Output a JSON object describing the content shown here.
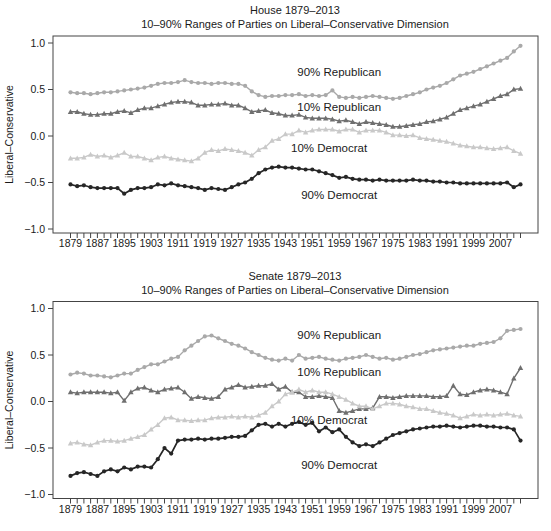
{
  "years": [
    1879,
    1881,
    1883,
    1885,
    1887,
    1889,
    1891,
    1893,
    1895,
    1897,
    1899,
    1901,
    1903,
    1905,
    1907,
    1909,
    1911,
    1913,
    1915,
    1917,
    1919,
    1921,
    1923,
    1925,
    1927,
    1929,
    1931,
    1933,
    1935,
    1937,
    1939,
    1941,
    1943,
    1945,
    1947,
    1949,
    1951,
    1953,
    1955,
    1957,
    1959,
    1961,
    1963,
    1965,
    1967,
    1969,
    1971,
    1973,
    1975,
    1977,
    1979,
    1981,
    1983,
    1985,
    1987,
    1989,
    1991,
    1993,
    1995,
    1997,
    1999,
    2001,
    2003,
    2005,
    2007,
    2009,
    2011,
    2013
  ],
  "colors": {
    "rep90": "#a9a9a9",
    "rep10": "#6f6f6f",
    "dem10": "#c9c9c9",
    "dem90": "#262626",
    "axis": "#444444",
    "text": "#1a1a1a"
  },
  "chart_data": [
    {
      "type": "line",
      "title": "House 1879–2013",
      "subtitle": "10–90% Ranges of Parties on Liberal–Conservative Dimension",
      "ylabel": "Liberal–Conservative",
      "ylim": [
        -1.0,
        1.0
      ],
      "yticks": [
        "1.0",
        "0.5",
        "0.0",
        "−0.5",
        "−1.0"
      ],
      "ytick_values": [
        1.0,
        0.5,
        0.0,
        -0.5,
        -1.0
      ],
      "xtick_label_years": [
        1879,
        1887,
        1895,
        1903,
        1911,
        1919,
        1927,
        1935,
        1943,
        1951,
        1959,
        1967,
        1975,
        1983,
        1991,
        1999,
        2007
      ],
      "grid": false,
      "legend": "in-plot text annotations",
      "series": [
        {
          "name": "90% Republican",
          "marker": "circle",
          "color": "#a9a9a9",
          "values": [
            0.47,
            0.46,
            0.46,
            0.45,
            0.46,
            0.47,
            0.47,
            0.48,
            0.49,
            0.5,
            0.51,
            0.52,
            0.54,
            0.56,
            0.57,
            0.57,
            0.58,
            0.6,
            0.58,
            0.57,
            0.57,
            0.56,
            0.57,
            0.57,
            0.56,
            0.56,
            0.54,
            0.48,
            0.44,
            0.42,
            0.43,
            0.43,
            0.44,
            0.44,
            0.45,
            0.43,
            0.44,
            0.43,
            0.44,
            0.49,
            0.42,
            0.41,
            0.42,
            0.41,
            0.42,
            0.43,
            0.42,
            0.41,
            0.4,
            0.41,
            0.43,
            0.45,
            0.47,
            0.5,
            0.52,
            0.54,
            0.57,
            0.61,
            0.65,
            0.67,
            0.69,
            0.72,
            0.75,
            0.78,
            0.81,
            0.84,
            0.91,
            0.97
          ]
        },
        {
          "name": "10% Republican",
          "marker": "triangle",
          "color": "#6f6f6f",
          "values": [
            0.26,
            0.26,
            0.24,
            0.23,
            0.23,
            0.24,
            0.24,
            0.26,
            0.27,
            0.25,
            0.28,
            0.3,
            0.3,
            0.32,
            0.34,
            0.36,
            0.37,
            0.37,
            0.36,
            0.33,
            0.33,
            0.34,
            0.34,
            0.35,
            0.33,
            0.33,
            0.3,
            0.26,
            0.27,
            0.28,
            0.25,
            0.24,
            0.22,
            0.22,
            0.23,
            0.2,
            0.19,
            0.19,
            0.19,
            0.18,
            0.16,
            0.17,
            0.15,
            0.13,
            0.15,
            0.14,
            0.13,
            0.12,
            0.1,
            0.1,
            0.11,
            0.12,
            0.13,
            0.15,
            0.16,
            0.18,
            0.2,
            0.24,
            0.28,
            0.3,
            0.32,
            0.34,
            0.37,
            0.4,
            0.43,
            0.45,
            0.5,
            0.51
          ]
        },
        {
          "name": "10% Democrat",
          "marker": "triangle",
          "color": "#c9c9c9",
          "values": [
            -0.24,
            -0.24,
            -0.23,
            -0.2,
            -0.22,
            -0.21,
            -0.23,
            -0.21,
            -0.18,
            -0.22,
            -0.22,
            -0.24,
            -0.26,
            -0.23,
            -0.22,
            -0.24,
            -0.25,
            -0.26,
            -0.27,
            -0.24,
            -0.18,
            -0.15,
            -0.16,
            -0.14,
            -0.15,
            -0.16,
            -0.18,
            -0.21,
            -0.15,
            -0.12,
            -0.05,
            -0.03,
            0.02,
            0.02,
            0.06,
            0.04,
            0.06,
            0.07,
            0.07,
            0.07,
            0.05,
            0.07,
            0.07,
            0.04,
            0.06,
            0.06,
            0.06,
            0.04,
            0.01,
            0.01,
            0.0,
            0.01,
            -0.02,
            -0.03,
            -0.04,
            -0.05,
            -0.06,
            -0.08,
            -0.1,
            -0.11,
            -0.12,
            -0.12,
            -0.13,
            -0.14,
            -0.13,
            -0.12,
            -0.16,
            -0.19
          ]
        },
        {
          "name": "90% Democrat",
          "marker": "circle",
          "color": "#262626",
          "values": [
            -0.52,
            -0.54,
            -0.53,
            -0.55,
            -0.56,
            -0.56,
            -0.56,
            -0.56,
            -0.62,
            -0.58,
            -0.56,
            -0.56,
            -0.55,
            -0.52,
            -0.53,
            -0.51,
            -0.53,
            -0.54,
            -0.55,
            -0.56,
            -0.58,
            -0.56,
            -0.57,
            -0.58,
            -0.55,
            -0.52,
            -0.5,
            -0.46,
            -0.4,
            -0.36,
            -0.34,
            -0.33,
            -0.34,
            -0.34,
            -0.35,
            -0.36,
            -0.36,
            -0.38,
            -0.4,
            -0.42,
            -0.45,
            -0.44,
            -0.46,
            -0.47,
            -0.47,
            -0.48,
            -0.47,
            -0.48,
            -0.48,
            -0.48,
            -0.48,
            -0.47,
            -0.48,
            -0.48,
            -0.49,
            -0.49,
            -0.5,
            -0.5,
            -0.51,
            -0.51,
            -0.51,
            -0.51,
            -0.51,
            -0.51,
            -0.51,
            -0.5,
            -0.55,
            -0.52
          ]
        }
      ],
      "annotations": [
        {
          "text": "90% Republican",
          "year": 1959,
          "value": 0.65
        },
        {
          "text": "10% Republican",
          "year": 1959,
          "value": 0.27
        },
        {
          "text": "10% Democrat",
          "year": 1956,
          "value": -0.17
        },
        {
          "text": "90% Democrat",
          "year": 1959,
          "value": -0.68
        }
      ]
    },
    {
      "type": "line",
      "title": "Senate 1879–2013",
      "subtitle": "10–90% Ranges of Parties on Liberal–Conservative Dimension",
      "ylabel": "Liberal–Conservative",
      "ylim": [
        -1.0,
        1.0
      ],
      "yticks": [
        "1.0",
        "0.5",
        "0.0",
        "−0.5",
        "−1.0"
      ],
      "ytick_values": [
        1.0,
        0.5,
        0.0,
        -0.5,
        -1.0
      ],
      "xtick_label_years": [
        1879,
        1887,
        1895,
        1903,
        1911,
        1919,
        1927,
        1935,
        1943,
        1951,
        1959,
        1967,
        1975,
        1983,
        1991,
        1999,
        2007
      ],
      "grid": false,
      "legend": "in-plot text annotations",
      "series": [
        {
          "name": "90% Republican",
          "marker": "circle",
          "color": "#a9a9a9",
          "values": [
            0.29,
            0.31,
            0.3,
            0.28,
            0.28,
            0.27,
            0.26,
            0.28,
            0.3,
            0.3,
            0.34,
            0.37,
            0.4,
            0.4,
            0.43,
            0.46,
            0.48,
            0.55,
            0.6,
            0.65,
            0.7,
            0.71,
            0.68,
            0.65,
            0.62,
            0.6,
            0.57,
            0.53,
            0.5,
            0.47,
            0.45,
            0.44,
            0.46,
            0.44,
            0.5,
            0.46,
            0.47,
            0.48,
            0.46,
            0.45,
            0.44,
            0.46,
            0.47,
            0.48,
            0.5,
            0.48,
            0.46,
            0.47,
            0.45,
            0.46,
            0.48,
            0.5,
            0.51,
            0.53,
            0.55,
            0.56,
            0.57,
            0.58,
            0.59,
            0.6,
            0.6,
            0.62,
            0.63,
            0.64,
            0.68,
            0.76,
            0.77,
            0.78
          ]
        },
        {
          "name": "10% Republican",
          "marker": "triangle",
          "color": "#6f6f6f",
          "values": [
            0.1,
            0.09,
            0.1,
            0.1,
            0.1,
            0.1,
            0.09,
            0.1,
            0.01,
            0.1,
            0.14,
            0.15,
            0.12,
            0.1,
            0.13,
            0.14,
            0.15,
            0.1,
            0.03,
            0.05,
            0.04,
            0.03,
            0.05,
            0.13,
            0.15,
            0.18,
            0.15,
            0.16,
            0.17,
            0.17,
            0.19,
            0.13,
            0.16,
            0.1,
            0.1,
            0.05,
            0.05,
            0.06,
            0.05,
            0.04,
            -0.1,
            -0.12,
            -0.1,
            -0.08,
            -0.08,
            -0.07,
            0.05,
            0.05,
            0.04,
            0.05,
            0.06,
            0.06,
            0.06,
            0.06,
            0.05,
            0.05,
            0.06,
            0.17,
            0.08,
            0.07,
            0.1,
            0.12,
            0.13,
            0.12,
            0.1,
            0.08,
            0.25,
            0.36
          ]
        },
        {
          "name": "10% Democrat",
          "marker": "triangle",
          "color": "#c9c9c9",
          "values": [
            -0.45,
            -0.44,
            -0.46,
            -0.47,
            -0.44,
            -0.42,
            -0.42,
            -0.43,
            -0.42,
            -0.4,
            -0.38,
            -0.36,
            -0.3,
            -0.25,
            -0.18,
            -0.17,
            -0.2,
            -0.2,
            -0.21,
            -0.2,
            -0.2,
            -0.18,
            -0.17,
            -0.17,
            -0.16,
            -0.17,
            -0.16,
            -0.17,
            -0.15,
            -0.12,
            -0.05,
            0.0,
            0.08,
            0.1,
            0.13,
            0.1,
            0.12,
            0.1,
            0.1,
            0.08,
            0.05,
            0.02,
            -0.02,
            -0.05,
            -0.05,
            -0.08,
            -0.05,
            -0.02,
            -0.02,
            -0.03,
            -0.05,
            -0.06,
            -0.08,
            -0.08,
            -0.1,
            -0.12,
            -0.13,
            -0.15,
            -0.18,
            -0.16,
            -0.14,
            -0.15,
            -0.14,
            -0.15,
            -0.14,
            -0.13,
            -0.15,
            -0.16
          ]
        },
        {
          "name": "90% Democrat",
          "marker": "circle",
          "color": "#262626",
          "values": [
            -0.8,
            -0.77,
            -0.76,
            -0.78,
            -0.8,
            -0.75,
            -0.73,
            -0.75,
            -0.71,
            -0.73,
            -0.7,
            -0.7,
            -0.71,
            -0.62,
            -0.5,
            -0.56,
            -0.42,
            -0.41,
            -0.41,
            -0.4,
            -0.41,
            -0.4,
            -0.4,
            -0.39,
            -0.38,
            -0.38,
            -0.37,
            -0.31,
            -0.25,
            -0.24,
            -0.27,
            -0.24,
            -0.27,
            -0.24,
            -0.22,
            -0.25,
            -0.23,
            -0.32,
            -0.28,
            -0.33,
            -0.3,
            -0.38,
            -0.44,
            -0.48,
            -0.46,
            -0.48,
            -0.44,
            -0.4,
            -0.36,
            -0.34,
            -0.32,
            -0.3,
            -0.29,
            -0.28,
            -0.27,
            -0.27,
            -0.26,
            -0.27,
            -0.28,
            -0.27,
            -0.26,
            -0.26,
            -0.27,
            -0.27,
            -0.28,
            -0.28,
            -0.3,
            -0.42
          ]
        }
      ],
      "annotations": [
        {
          "text": "90% Republican",
          "year": 1959,
          "value": 0.67
        },
        {
          "text": "10% Republican",
          "year": 1959,
          "value": 0.28
        },
        {
          "text": "10% Democrat",
          "year": 1956,
          "value": -0.24
        },
        {
          "text": "90% Democrat",
          "year": 1959,
          "value": -0.72
        }
      ]
    }
  ]
}
